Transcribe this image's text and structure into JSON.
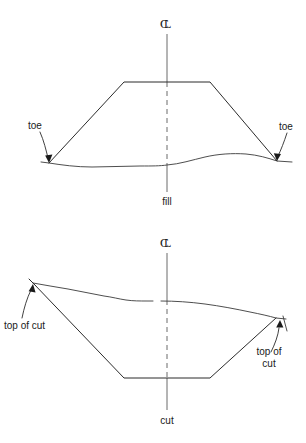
{
  "figure": {
    "type": "engineering-cross-section-diagram",
    "background_color": "#ffffff",
    "line_color": "#2b2b2b",
    "centerline_color": "#6a6a6a",
    "panels": [
      {
        "id": "fill",
        "caption": "fill",
        "centerline_symbol": "℄",
        "centerline_symbol_parts": {
          "c": "C",
          "l": "L"
        },
        "annotations": [
          {
            "id": "toe-left",
            "label": "toe"
          },
          {
            "id": "toe-right",
            "label": "toe"
          }
        ]
      },
      {
        "id": "cut",
        "caption": "cut",
        "centerline_symbol": "℄",
        "centerline_symbol_parts": {
          "c": "C",
          "l": "L"
        },
        "annotations": [
          {
            "id": "top-of-cut-left",
            "label": "top of cut"
          },
          {
            "id": "top-of-cut-right",
            "label_line1": "top of",
            "label_line2": "cut"
          }
        ]
      }
    ]
  }
}
